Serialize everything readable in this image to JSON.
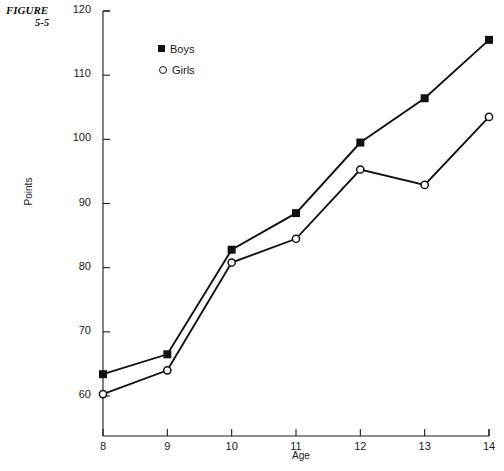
{
  "figure": {
    "line1": "FIGURE",
    "line2": "5-5"
  },
  "legend": {
    "position": "top-center-left",
    "entries": [
      {
        "label": "Boys",
        "marker": "filled-square-marker",
        "color": "#111111"
      },
      {
        "label": "Girls",
        "marker": "open-circle-marker",
        "color": "#111111"
      }
    ]
  },
  "chart_data": {
    "type": "line",
    "title": "",
    "xlabel": "Age",
    "ylabel": "Points",
    "x": [
      8,
      9,
      10,
      11,
      12,
      13,
      14
    ],
    "xticklabels": [
      "8",
      "9",
      "10",
      "11",
      "12",
      "13",
      "14"
    ],
    "yticks": [
      60,
      70,
      80,
      90,
      100,
      110,
      120
    ],
    "yticklabels": [
      "60",
      "70",
      "80",
      "90",
      "100",
      "110",
      "120"
    ],
    "xlim": [
      8,
      14
    ],
    "ylim": [
      60,
      120
    ],
    "grid": false,
    "legend_position": "upper left inside",
    "series": [
      {
        "name": "Boys",
        "marker": "filled-square",
        "values": [
          63.4,
          66.5,
          82.8,
          88.5,
          99.5,
          106.4,
          115.5
        ]
      },
      {
        "name": "Girls",
        "marker": "open-circle",
        "values": [
          60.3,
          64.0,
          80.8,
          84.5,
          95.3,
          92.9,
          103.5
        ]
      }
    ]
  }
}
